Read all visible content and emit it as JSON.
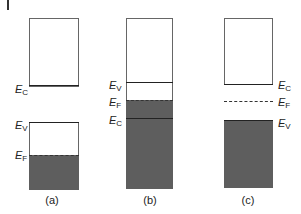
{
  "figure": {
    "panels": [
      {
        "caption": "(a)",
        "type": "insulator-or-semiconductor (Fermi level inside valence band)",
        "levels": {
          "E_C": "E",
          "E_V": "E",
          "E_F": "E"
        },
        "label_sub": {
          "E_C": "C",
          "E_V": "V",
          "E_F": "F"
        }
      },
      {
        "caption": "(b)",
        "type": "semimetal (bands overlap)",
        "label_sub": {
          "E_V": "V",
          "E_F": "F",
          "E_C": "C"
        }
      },
      {
        "caption": "(c)",
        "type": "semiconductor (Fermi level in gap)",
        "label_sub": {
          "E_C": "C",
          "E_F": "F",
          "E_V": "V"
        }
      }
    ],
    "letter": "E",
    "colors": {
      "filled": "#5e5e5e",
      "outline": "#666666",
      "line": "#222222"
    }
  },
  "a": {
    "cap": "(a)",
    "ec": "C",
    "ev": "V",
    "ef": "F",
    "E": "E"
  },
  "b": {
    "cap": "(b)",
    "ec": "C",
    "ev": "V",
    "ef": "F",
    "E": "E"
  },
  "c": {
    "cap": "(c)",
    "ec": "C",
    "ev": "V",
    "ef": "F",
    "E": "E"
  }
}
